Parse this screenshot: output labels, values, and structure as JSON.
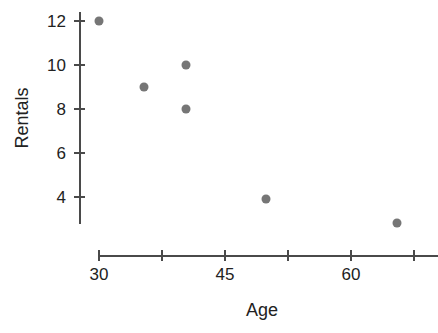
{
  "chart_data": {
    "type": "scatter",
    "title": "",
    "xlabel": "Age",
    "ylabel": "Rentals",
    "xlim": [
      30,
      75
    ],
    "ylim": [
      2.5,
      12.5
    ],
    "grid": false,
    "legend": null,
    "x_ticks": [
      30,
      37.5,
      45,
      52.5,
      60,
      67.5
    ],
    "x_tick_labels": [
      "30",
      "",
      "45",
      "",
      "60",
      ""
    ],
    "y_ticks": [
      4,
      6,
      8,
      10,
      12
    ],
    "y_tick_labels": [
      "4",
      "6",
      "8",
      "10",
      "12"
    ],
    "marker_color": "#767676",
    "axis_color": "#4a4a4a",
    "points": [
      {
        "x": 30,
        "y": 12
      },
      {
        "x": 35.3,
        "y": 9
      },
      {
        "x": 40.3,
        "y": 10
      },
      {
        "x": 40.3,
        "y": 8
      },
      {
        "x": 49.9,
        "y": 3.9
      },
      {
        "x": 65.5,
        "y": 2.8
      }
    ]
  }
}
